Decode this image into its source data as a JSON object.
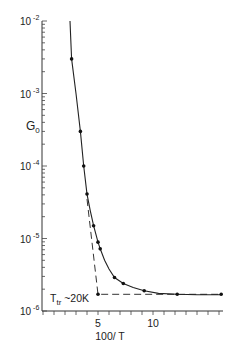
{
  "chart_data": {
    "type": "scatter",
    "title": "",
    "xlabel": "100/ T",
    "ylabel": "G0",
    "ylabel_main": "G",
    "ylabel_sub": "0",
    "yscale": "log",
    "xlim": [
      0,
      16.3
    ],
    "ylim": [
      1e-06,
      0.01
    ],
    "x_ticks": [
      {
        "value": 5,
        "label": "5"
      },
      {
        "value": 10,
        "label": "10"
      }
    ],
    "y_ticks": [
      {
        "exp": -2,
        "base": "10",
        "sup": "-2"
      },
      {
        "exp": -3,
        "base": "10",
        "sup": "-3"
      },
      {
        "exp": -4,
        "base": "10",
        "sup": "-4"
      },
      {
        "exp": -5,
        "base": "10",
        "sup": "-5"
      },
      {
        "exp": -6,
        "base": "10",
        "sup": "-6"
      }
    ],
    "grid": false,
    "series": [
      {
        "name": "measured",
        "x": [
          2.6,
          3.4,
          3.7,
          4.0,
          4.6,
          5.0,
          5.2,
          6.5,
          7.3,
          9.2,
          12.2,
          16.2
        ],
        "y": [
          0.003,
          0.0003,
          0.0001,
          4.1e-05,
          1.5e-05,
          8.9e-06,
          7.2e-06,
          2.9e-06,
          2.4e-06,
          1.9e-06,
          1.7e-06,
          1.7e-06
        ]
      }
    ],
    "fit_curve": {
      "x": [
        2.45,
        2.6,
        3.0,
        3.4,
        3.7,
        4.0,
        4.3,
        4.6,
        5.0,
        5.2,
        5.6,
        6.0,
        6.5,
        7.3,
        8.2,
        9.2,
        10.5,
        12.2,
        14.0,
        16.2
      ],
      "y": [
        0.01,
        0.003,
        0.001,
        0.0003,
        0.0001,
        4.1e-05,
        2.4e-05,
        1.5e-05,
        8.9e-06,
        7.2e-06,
        5e-06,
        3.8e-06,
        2.9e-06,
        2.4e-06,
        2.1e-06,
        1.9e-06,
        1.75e-06,
        1.7e-06,
        1.68e-06,
        1.68e-06
      ]
    },
    "dashed_extrapolation": {
      "x": [
        4.0,
        5.0,
        16.2
      ],
      "y": [
        3.5e-05,
        1.7e-06,
        1.7e-06
      ]
    },
    "annotations": [
      {
        "text_main": "T",
        "text_sub": "tr",
        "text_rest": " ~20K",
        "x": 5.0,
        "y": 1.7e-06
      }
    ]
  }
}
